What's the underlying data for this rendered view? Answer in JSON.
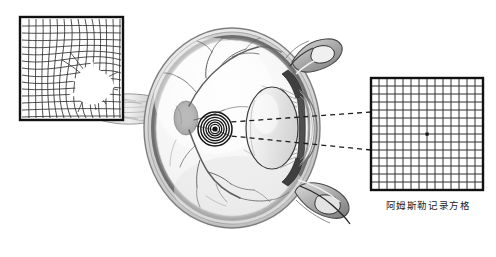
{
  "figure": {
    "title_caption": "阿姆斯勒记录方格",
    "background_color": "#ffffff",
    "width": 496,
    "height": 257
  },
  "grids": {
    "distorted": {
      "name": "distorted-amsler-grid",
      "x": 20,
      "y": 17,
      "size": 103,
      "cells": 14,
      "border_color": "#111111",
      "line_color": "#2a2a2a",
      "distortion": {
        "center_x": 0.63,
        "center_y": 0.62,
        "blank_radius": 0.13,
        "warp_strength": 0.42
      },
      "label": ""
    },
    "normal": {
      "name": "normal-amsler-grid",
      "x": 371,
      "y": 78,
      "size": 112,
      "cells": 14,
      "border_color": "#111111",
      "line_color": "#2a2a2a",
      "center_dot": true,
      "center_dot_color": "#111111",
      "label": "阿姆斯勒记录方格"
    }
  },
  "eye": {
    "name": "eye-cross-section",
    "center_x": 232,
    "center_y": 128,
    "radius_x": 88,
    "radius_y": 100,
    "colors": {
      "sclera": "#e8e8e8",
      "sclera_outline": "#8c8c8c",
      "choroid": "#6e6e6e",
      "retina_interior": "#f4f4f4",
      "vessel": "#5a5a5a",
      "lens": "#ededed",
      "lens_outline": "#3a3a3a",
      "ciliary": "#4a4a4a",
      "eyelid": "#9a9a9a",
      "macula_ring": "#1a1a1a"
    },
    "parts": {
      "optic_nerve": "optic-nerve",
      "optic_disc": "optic-disc",
      "macula": "macula-bullseye",
      "lens": "crystalline-lens",
      "cornea": "cornea",
      "ciliary_body": "ciliary-body",
      "upper_eyelid": "upper-eyelid",
      "lower_eyelid": "lower-eyelid",
      "vitreous": "vitreous-body"
    },
    "macula": {
      "center_x": 215,
      "center_y": 129,
      "rings": 7,
      "outer_radius": 17
    }
  },
  "light_rays": {
    "name": "light-ray-lines",
    "style": "dashed",
    "color": "#1c1c1c",
    "dash": "5 4",
    "rays": [
      {
        "from_x": 371,
        "from_y": 112,
        "to_x": 231,
        "to_y": 122
      },
      {
        "from_x": 371,
        "from_y": 150,
        "to_x": 231,
        "to_y": 136
      }
    ]
  }
}
